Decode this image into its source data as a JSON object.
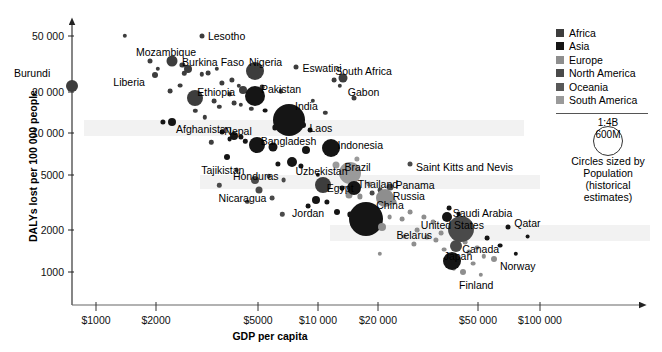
{
  "chart_data": {
    "type": "scatter",
    "title": "",
    "xlabel": "GDP per capita",
    "ylabel": "DALYs lost per 100 000 people",
    "xscale": "log",
    "yscale": "log",
    "xlim": [
      700,
      130000
    ],
    "ylim": [
      700,
      70000
    ],
    "grid": false,
    "legend_position": "top-right",
    "xticks": [
      "$1000",
      "$2000",
      "$5000",
      "$10 000",
      "$20 000",
      "$50 000",
      "$100 000"
    ],
    "xtick_values": [
      1000,
      2000,
      5000,
      10000,
      20000,
      50000,
      100000
    ],
    "yticks": [
      "50 000",
      "20 000",
      "10 000",
      "5000",
      "2000",
      "1000"
    ],
    "ytick_values": [
      50000,
      20000,
      10000,
      5000,
      2000,
      1000
    ],
    "size_encoding": "Population (historical estimates)",
    "legend": {
      "entries": [
        {
          "name": "Africa",
          "color": "#3d3d3d"
        },
        {
          "name": "Asia",
          "color": "#151515"
        },
        {
          "name": "Europe",
          "color": "#8e8e8e"
        },
        {
          "name": "North America",
          "color": "#4a4a4a"
        },
        {
          "name": "Oceania",
          "color": "#585858"
        },
        {
          "name": "South America",
          "color": "#9a9a9a"
        }
      ],
      "size_scale_top": "1:4B",
      "size_scale_inner": "600M",
      "size_caption_line1": "Circles sized by",
      "size_caption_line2": "Population",
      "size_caption_line3": "(historical",
      "size_caption_line4": "estimates)"
    },
    "points": [
      {
        "name": "Burundi",
        "x": 780,
        "y": 22000,
        "r": 6,
        "color": "#3d3d3d",
        "lx": -58,
        "ly": -18
      },
      {
        "name": "Mozambique",
        "x": 2200,
        "y": 33000,
        "r": 5.5,
        "color": "#3d3d3d",
        "lx": -36,
        "ly": -14
      },
      {
        "name": "Lesotho",
        "x": 3000,
        "y": 50000,
        "r": 2.5,
        "color": "#3d3d3d",
        "lx": 6,
        "ly": -5
      },
      {
        "name": "Liberia",
        "x": 1850,
        "y": 26000,
        "r": 3,
        "color": "#3d3d3d",
        "lx": -42,
        "ly": 2
      },
      {
        "name": "Burkina Faso",
        "x": 2600,
        "y": 29000,
        "r": 4,
        "color": "#3d3d3d",
        "lx": -6,
        "ly": -12
      },
      {
        "name": "Ethiopia",
        "x": 2800,
        "y": 18000,
        "r": 8,
        "color": "#3d3d3d",
        "lx": 2,
        "ly": -11
      },
      {
        "name": "Afghanistan",
        "x": 2200,
        "y": 12000,
        "r": 4,
        "color": "#151515",
        "lx": 4,
        "ly": 2
      },
      {
        "name": "Nigeria",
        "x": 5200,
        "y": 28000,
        "r": 9,
        "color": "#3d3d3d",
        "lx": -6,
        "ly": -14
      },
      {
        "name": "Eswatini",
        "x": 8000,
        "y": 30000,
        "r": 2.5,
        "color": "#3d3d3d",
        "lx": 6,
        "ly": -4
      },
      {
        "name": "Pakistan",
        "x": 5200,
        "y": 18500,
        "r": 10,
        "color": "#151515",
        "lx": 6,
        "ly": -12
      },
      {
        "name": "India",
        "x": 7400,
        "y": 12500,
        "r": 16,
        "color": "#151515",
        "lx": 6,
        "ly": -19
      },
      {
        "name": "Laos",
        "x": 8600,
        "y": 11500,
        "r": 3,
        "color": "#151515",
        "lx": 6,
        "ly": -2
      },
      {
        "name": "Nepal",
        "x": 4200,
        "y": 9600,
        "r": 4,
        "color": "#151515",
        "lx": -10,
        "ly": -10
      },
      {
        "name": "Bangladesh",
        "x": 5300,
        "y": 8200,
        "r": 8,
        "color": "#151515",
        "lx": 4,
        "ly": -9
      },
      {
        "name": "Tajikistan",
        "x": 3900,
        "y": 6700,
        "r": 3,
        "color": "#151515",
        "lx": -26,
        "ly": 8
      },
      {
        "name": "South Africa",
        "x": 13000,
        "y": 25000,
        "r": 4.5,
        "color": "#3d3d3d",
        "lx": -8,
        "ly": -12
      },
      {
        "name": "Gabon",
        "x": 14500,
        "y": 18000,
        "r": 2.5,
        "color": "#3d3d3d",
        "lx": -6,
        "ly": -11
      },
      {
        "name": "Indonesia",
        "x": 11500,
        "y": 7800,
        "r": 9,
        "color": "#151515",
        "lx": 6,
        "ly": -8
      },
      {
        "name": "Uzbekistan",
        "x": 7600,
        "y": 6200,
        "r": 5,
        "color": "#151515",
        "lx": 4,
        "ly": 4
      },
      {
        "name": "Brazil",
        "x": 14000,
        "y": 5200,
        "r": 11,
        "color": "#9a9a9a",
        "lx": -6,
        "ly": -11
      },
      {
        "name": "Saint Kitts and Nevis",
        "x": 26000,
        "y": 6000,
        "r": 2.5,
        "color": "#4a4a4a",
        "lx": 6,
        "ly": -2
      },
      {
        "name": "Honduras",
        "x": 5200,
        "y": 4600,
        "r": 4,
        "color": "#4a4a4a",
        "lx": -22,
        "ly": -9
      },
      {
        "name": "Nicaragua",
        "x": 5400,
        "y": 3900,
        "r": 3.5,
        "color": "#4a4a4a",
        "lx": -40,
        "ly": 3
      },
      {
        "name": "Egypt",
        "x": 10500,
        "y": 4200,
        "r": 8,
        "color": "#3d3d3d",
        "lx": 4,
        "ly": -2
      },
      {
        "name": "Jordan",
        "x": 9800,
        "y": 3300,
        "r": 4,
        "color": "#151515",
        "lx": -24,
        "ly": 8
      },
      {
        "name": "Thailand",
        "x": 14500,
        "y": 4000,
        "r": 7,
        "color": "#151515",
        "lx": 4,
        "ly": -9
      },
      {
        "name": "Panama",
        "x": 21000,
        "y": 4100,
        "r": 3.5,
        "color": "#4a4a4a",
        "lx": 6,
        "ly": -7
      },
      {
        "name": "Russia",
        "x": 20000,
        "y": 3400,
        "r": 9,
        "color": "#8e8e8e",
        "lx": 8,
        "ly": -7
      },
      {
        "name": "China",
        "x": 16500,
        "y": 2400,
        "r": 17,
        "color": "#151515",
        "lx": 10,
        "ly": -19
      },
      {
        "name": "Belarus",
        "x": 19500,
        "y": 2100,
        "r": 4,
        "color": "#8e8e8e",
        "lx": 14,
        "ly": 3
      },
      {
        "name": "Saudi Arabia",
        "x": 38000,
        "y": 2500,
        "r": 5,
        "color": "#151515",
        "lx": 6,
        "ly": -9
      },
      {
        "name": "United States",
        "x": 44000,
        "y": 2050,
        "r": 13,
        "color": "#4a4a4a",
        "lx": -40,
        "ly": -9
      },
      {
        "name": "Qatar",
        "x": 72000,
        "y": 2100,
        "r": 2.5,
        "color": "#151515",
        "lx": 6,
        "ly": -9
      },
      {
        "name": "Canada",
        "x": 42000,
        "y": 1550,
        "r": 6,
        "color": "#4a4a4a",
        "lx": 6,
        "ly": -2
      },
      {
        "name": "Japan",
        "x": 40000,
        "y": 1200,
        "r": 9,
        "color": "#151515",
        "lx": -8,
        "ly": -10
      },
      {
        "name": "Norway",
        "x": 62000,
        "y": 1250,
        "r": 3,
        "color": "#8e8e8e",
        "lx": 6,
        "ly": 2
      },
      {
        "name": "Finland",
        "x": 45000,
        "y": 1000,
        "r": 3,
        "color": "#8e8e8e",
        "lx": -4,
        "ly": 8
      }
    ],
    "unlabeled_points": [
      {
        "x": 1350,
        "y": 50000,
        "r": 2.2,
        "color": "#3d3d3d"
      },
      {
        "x": 1750,
        "y": 33000,
        "r": 2.5,
        "color": "#3d3d3d"
      },
      {
        "x": 1900,
        "y": 29000,
        "r": 2.2,
        "color": "#3d3d3d"
      },
      {
        "x": 2450,
        "y": 31000,
        "r": 2.6,
        "color": "#3d3d3d"
      },
      {
        "x": 2500,
        "y": 27000,
        "r": 2.2,
        "color": "#3d3d3d"
      },
      {
        "x": 3000,
        "y": 26500,
        "r": 2.2,
        "color": "#3d3d3d"
      },
      {
        "x": 3200,
        "y": 27000,
        "r": 2.4,
        "color": "#3d3d3d"
      },
      {
        "x": 3500,
        "y": 29000,
        "r": 2.2,
        "color": "#3d3d3d"
      },
      {
        "x": 2400,
        "y": 22000,
        "r": 2.4,
        "color": "#3d3d3d"
      },
      {
        "x": 2150,
        "y": 20000,
        "r": 2.4,
        "color": "#3d3d3d"
      },
      {
        "x": 3700,
        "y": 23000,
        "r": 2.6,
        "color": "#3d3d3d"
      },
      {
        "x": 4100,
        "y": 24000,
        "r": 2.6,
        "color": "#3d3d3d"
      },
      {
        "x": 4400,
        "y": 22000,
        "r": 2.2,
        "color": "#3d3d3d"
      },
      {
        "x": 4000,
        "y": 19000,
        "r": 2.4,
        "color": "#3d3d3d"
      },
      {
        "x": 4600,
        "y": 20500,
        "r": 4,
        "color": "#3d3d3d"
      },
      {
        "x": 5600,
        "y": 21500,
        "r": 2.4,
        "color": "#3d3d3d"
      },
      {
        "x": 6800,
        "y": 20000,
        "r": 2.2,
        "color": "#3d3d3d"
      },
      {
        "x": 3400,
        "y": 17000,
        "r": 2.4,
        "color": "#3d3d3d"
      },
      {
        "x": 3600,
        "y": 15500,
        "r": 2.2,
        "color": "#3d3d3d"
      },
      {
        "x": 4200,
        "y": 16500,
        "r": 2.4,
        "color": "#3d3d3d"
      },
      {
        "x": 4500,
        "y": 16000,
        "r": 2.2,
        "color": "#3d3d3d"
      },
      {
        "x": 5000,
        "y": 15000,
        "r": 2.2,
        "color": "#3d3d3d"
      },
      {
        "x": 2800,
        "y": 14500,
        "r": 2.2,
        "color": "#3d3d3d"
      },
      {
        "x": 3100,
        "y": 13000,
        "r": 2.2,
        "color": "#3d3d3d"
      },
      {
        "x": 5800,
        "y": 14500,
        "r": 2.4,
        "color": "#151515"
      },
      {
        "x": 9500,
        "y": 17000,
        "r": 2.2,
        "color": "#3d3d3d"
      },
      {
        "x": 11800,
        "y": 24000,
        "r": 2.4,
        "color": "#3d3d3d"
      },
      {
        "x": 12500,
        "y": 22000,
        "r": 2.2,
        "color": "#3d3d3d"
      },
      {
        "x": 3700,
        "y": 10200,
        "r": 2.4,
        "color": "#151515"
      },
      {
        "x": 4000,
        "y": 9000,
        "r": 2.4,
        "color": "#151515"
      },
      {
        "x": 4500,
        "y": 9400,
        "r": 2.6,
        "color": "#151515"
      },
      {
        "x": 4700,
        "y": 8700,
        "r": 2.2,
        "color": "#151515"
      },
      {
        "x": 3300,
        "y": 8600,
        "r": 2.2,
        "color": "#3d3d3d"
      },
      {
        "x": 6300,
        "y": 8000,
        "r": 4.5,
        "color": "#151515"
      },
      {
        "x": 8800,
        "y": 7600,
        "r": 4,
        "color": "#151515"
      },
      {
        "x": 6600,
        "y": 6000,
        "r": 2.6,
        "color": "#151515"
      },
      {
        "x": 8400,
        "y": 5800,
        "r": 2.6,
        "color": "#151515"
      },
      {
        "x": 12000,
        "y": 5900,
        "r": 3.5,
        "color": "#9a9a9a"
      },
      {
        "x": 4300,
        "y": 5400,
        "r": 2.4,
        "color": "#4a4a4a"
      },
      {
        "x": 6000,
        "y": 4900,
        "r": 2.2,
        "color": "#4a4a4a"
      },
      {
        "x": 7000,
        "y": 4600,
        "r": 2.4,
        "color": "#4a4a4a"
      },
      {
        "x": 12800,
        "y": 4000,
        "r": 2.4,
        "color": "#151515"
      },
      {
        "x": 13800,
        "y": 3600,
        "r": 3.5,
        "color": "#8e8e8e"
      },
      {
        "x": 15500,
        "y": 3500,
        "r": 2.6,
        "color": "#8e8e8e"
      },
      {
        "x": 17500,
        "y": 3700,
        "r": 2.4,
        "color": "#4a4a4a"
      },
      {
        "x": 19000,
        "y": 3900,
        "r": 2.4,
        "color": "#4a4a4a"
      },
      {
        "x": 22000,
        "y": 3200,
        "r": 2.4,
        "color": "#8e8e8e"
      },
      {
        "x": 11000,
        "y": 3200,
        "r": 2.6,
        "color": "#151515"
      },
      {
        "x": 9000,
        "y": 3000,
        "r": 2.4,
        "color": "#151515"
      },
      {
        "x": 12200,
        "y": 2700,
        "r": 3,
        "color": "#151515"
      },
      {
        "x": 14000,
        "y": 2600,
        "r": 2.6,
        "color": "#151515"
      },
      {
        "x": 21000,
        "y": 2500,
        "r": 2.4,
        "color": "#8e8e8e"
      },
      {
        "x": 24000,
        "y": 2400,
        "r": 2.4,
        "color": "#8e8e8e"
      },
      {
        "x": 26000,
        "y": 2700,
        "r": 2.4,
        "color": "#8e8e8e"
      },
      {
        "x": 30000,
        "y": 2500,
        "r": 2.6,
        "color": "#8e8e8e"
      },
      {
        "x": 33000,
        "y": 2300,
        "r": 2.4,
        "color": "#8e8e8e"
      },
      {
        "x": 28000,
        "y": 2000,
        "r": 2.4,
        "color": "#8e8e8e"
      },
      {
        "x": 31000,
        "y": 1800,
        "r": 2.6,
        "color": "#8e8e8e"
      },
      {
        "x": 34000,
        "y": 1700,
        "r": 2.6,
        "color": "#8e8e8e"
      },
      {
        "x": 36000,
        "y": 1900,
        "r": 2.4,
        "color": "#8e8e8e"
      },
      {
        "x": 24500,
        "y": 1800,
        "r": 2.4,
        "color": "#8e8e8e"
      },
      {
        "x": 27000,
        "y": 1600,
        "r": 2.6,
        "color": "#8e8e8e"
      },
      {
        "x": 37000,
        "y": 1450,
        "r": 2.4,
        "color": "#8e8e8e"
      },
      {
        "x": 46000,
        "y": 1650,
        "r": 2.4,
        "color": "#8e8e8e"
      },
      {
        "x": 48000,
        "y": 1400,
        "r": 2.6,
        "color": "#8e8e8e"
      },
      {
        "x": 52000,
        "y": 1500,
        "r": 2.4,
        "color": "#8e8e8e"
      },
      {
        "x": 56000,
        "y": 1300,
        "r": 2.2,
        "color": "#8e8e8e"
      },
      {
        "x": 50000,
        "y": 1150,
        "r": 2.4,
        "color": "#8e8e8e"
      },
      {
        "x": 58000,
        "y": 1750,
        "r": 2.4,
        "color": "#151515"
      },
      {
        "x": 66000,
        "y": 1550,
        "r": 2.4,
        "color": "#151515"
      },
      {
        "x": 78000,
        "y": 1350,
        "r": 2.2,
        "color": "#151515"
      },
      {
        "x": 88000,
        "y": 1800,
        "r": 2.4,
        "color": "#151515"
      },
      {
        "x": 43000,
        "y": 2600,
        "r": 2.4,
        "color": "#151515"
      },
      {
        "x": 39000,
        "y": 2900,
        "r": 2.4,
        "color": "#151515"
      },
      {
        "x": 17000,
        "y": 4300,
        "r": 2.4,
        "color": "#9a9a9a"
      },
      {
        "x": 10000,
        "y": 5000,
        "r": 2.2,
        "color": "#151515"
      },
      {
        "x": 6200,
        "y": 3400,
        "r": 2.4,
        "color": "#4a4a4a"
      },
      {
        "x": 4800,
        "y": 3200,
        "r": 2.2,
        "color": "#4a4a4a"
      },
      {
        "x": 3600,
        "y": 4200,
        "r": 2.2,
        "color": "#4a4a4a"
      },
      {
        "x": 15000,
        "y": 6500,
        "r": 2.6,
        "color": "#9a9a9a"
      },
      {
        "x": 9200,
        "y": 10500,
        "r": 2.4,
        "color": "#151515"
      },
      {
        "x": 7800,
        "y": 13500,
        "r": 2.4,
        "color": "#151515"
      },
      {
        "x": 6400,
        "y": 11000,
        "r": 2.6,
        "color": "#151515"
      },
      {
        "x": 2000,
        "y": 12000,
        "r": 2.6,
        "color": "#151515"
      },
      {
        "x": 10800,
        "y": 14000,
        "r": 2.2,
        "color": "#3d3d3d"
      },
      {
        "x": 19000,
        "y": 1350,
        "r": 2.2,
        "color": "#8e8e8e"
      },
      {
        "x": 41000,
        "y": 1050,
        "r": 2.2,
        "color": "#8e8e8e"
      },
      {
        "x": 54000,
        "y": 950,
        "r": 2.2,
        "color": "#8e8e8e"
      },
      {
        "x": 6900,
        "y": 2600,
        "r": 2.2,
        "color": "#4a4a4a"
      }
    ]
  }
}
